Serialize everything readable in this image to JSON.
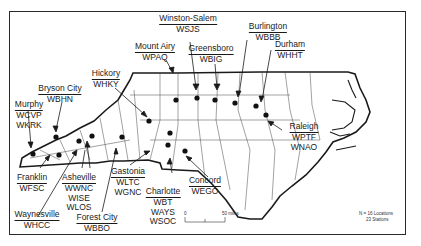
{
  "map": {
    "region": "North Carolina",
    "note": {
      "line1": "N = 16 Locations",
      "line2": "23 Stations"
    },
    "scale": {
      "start": "0",
      "end": "50 miles"
    },
    "colors": {
      "ink": "#1a1a1a",
      "background": "#ffffff"
    }
  },
  "locations": [
    {
      "city": "Winston-Salem",
      "stations": [
        "WSJS"
      ]
    },
    {
      "city": "Burlington",
      "stations": [
        "WBBB"
      ]
    },
    {
      "city": "Mount Airy",
      "stations": [
        "WPAQ"
      ]
    },
    {
      "city": "Greensboro",
      "stations": [
        "WBIG"
      ]
    },
    {
      "city": "Durham",
      "stations": [
        "WHHT"
      ]
    },
    {
      "city": "Hickory",
      "stations": [
        "WHKY"
      ]
    },
    {
      "city": "Bryson City",
      "stations": [
        "WBHN"
      ]
    },
    {
      "city": "Murphy",
      "stations": [
        "WCVP",
        "WKRK"
      ]
    },
    {
      "city": "Raleigh",
      "stations": [
        "WPTF",
        "WNAO"
      ]
    },
    {
      "city": "Franklin",
      "stations": [
        "WFSC"
      ]
    },
    {
      "city": "Asheville",
      "stations": [
        "WWNC",
        "WISE",
        "WLOS"
      ]
    },
    {
      "city": "Gastonia",
      "stations": [
        "WLTC",
        "WGNC"
      ]
    },
    {
      "city": "Concord",
      "stations": [
        "WEGO"
      ]
    },
    {
      "city": "Charlotte",
      "stations": [
        "WBT",
        "WAYS",
        "WSOC"
      ]
    },
    {
      "city": "Waynesville",
      "stations": [
        "WHCC"
      ]
    },
    {
      "city": "Forest City",
      "stations": [
        "WBBO"
      ]
    }
  ]
}
